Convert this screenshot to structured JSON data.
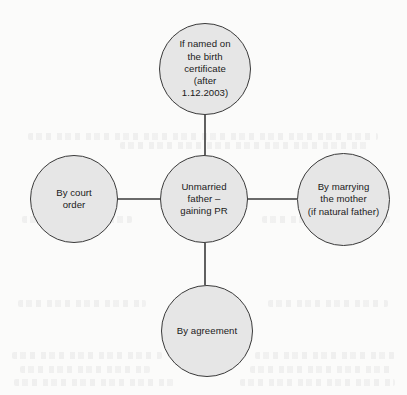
{
  "diagram": {
    "type": "radial-hub-and-spoke",
    "background_color": "#fbfbfa",
    "node_fill_color": "#e6e6e6",
    "node_stroke_color": "#3a3a3a",
    "connector_color": "#3a3a3a",
    "text_color": "#1a1a1a",
    "center": {
      "id": "center",
      "label": "Unmarried\nfather –\ngaining PR"
    },
    "branches": [
      {
        "id": "top",
        "label": "If named on\nthe birth\ncertificate\n(after\n1.12.2003)"
      },
      {
        "id": "left",
        "label": "By court\norder"
      },
      {
        "id": "right",
        "label": "By marrying\nthe mother\n(if natural father)"
      },
      {
        "id": "bottom",
        "label": "By agreement"
      }
    ],
    "connectors": [
      {
        "id": "connector-top",
        "from": "center",
        "to": "top",
        "x1": 205,
        "y1": 155,
        "x2": 205,
        "y2": 115
      },
      {
        "id": "connector-left",
        "from": "center",
        "to": "left",
        "x1": 160,
        "y1": 199,
        "x2": 118,
        "y2": 199
      },
      {
        "id": "connector-right",
        "from": "center",
        "to": "right",
        "x1": 248,
        "y1": 199,
        "x2": 297,
        "y2": 199
      },
      {
        "id": "connector-bottom",
        "from": "center",
        "to": "bottom",
        "x1": 205,
        "y1": 243,
        "x2": 205,
        "y2": 285
      }
    ]
  }
}
